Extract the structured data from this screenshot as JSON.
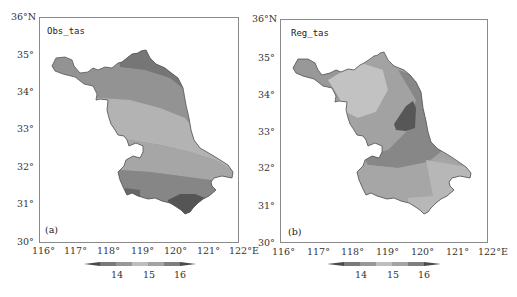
{
  "figure": {
    "panels": [
      {
        "id": "a",
        "title": "Obs_tas",
        "panel_label": "(a)",
        "lat_ticks": [
          "36°N",
          "35°",
          "34°",
          "33°",
          "32°",
          "31°",
          "30°"
        ],
        "lon_ticks": [
          "116°",
          "117°",
          "118°",
          "119°",
          "120°",
          "121°",
          "122°E"
        ],
        "colorbar_ticks": [
          "14",
          "15",
          "16"
        ]
      },
      {
        "id": "b",
        "title": "Reg_tas",
        "panel_label": "(b)",
        "lat_ticks": [
          "36°N",
          "35°",
          "34°",
          "33°",
          "32°",
          "31°",
          "30°"
        ],
        "lon_ticks": [
          "116°",
          "117°",
          "118°",
          "119°",
          "120°",
          "121°",
          "122°E"
        ],
        "colorbar_ticks": [
          "14",
          "15",
          "16"
        ]
      }
    ],
    "colorbar_levels": {
      "colors": [
        "#5a5a5a",
        "#8c8c8c",
        "#a6a6a6",
        "#bdbdbd",
        "#a0a0a0",
        "#7a7a7a",
        "#4a4a4a"
      ]
    },
    "colors": {
      "frame": "#8a8a8a",
      "shade_dark": "#5e5e5e",
      "shade_mid_dark": "#7f7f7f",
      "shade_mid": "#989898",
      "shade_light": "#b4b4b4",
      "shade_lighter": "#c4c4c4"
    }
  }
}
